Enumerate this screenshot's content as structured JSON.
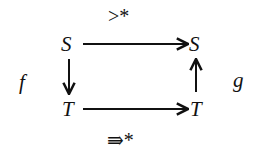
{
  "diagram": {
    "nodes": {
      "top_left": "S",
      "top_right": "S",
      "bottom_left": "T",
      "bottom_right": "T"
    },
    "labels": {
      "left": "f",
      "right": "g",
      "top": ">*",
      "bottom": "⇛*"
    },
    "edges": [
      {
        "from": "top_left",
        "to": "top_right",
        "label": ">*"
      },
      {
        "from": "top_left",
        "to": "bottom_left",
        "label": "f"
      },
      {
        "from": "bottom_left",
        "to": "bottom_right",
        "label": "⇛*"
      },
      {
        "from": "bottom_right",
        "to": "top_right",
        "label": "g"
      }
    ]
  }
}
